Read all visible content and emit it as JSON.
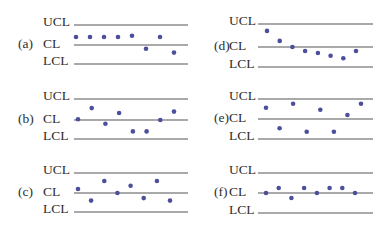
{
  "chart_data": [
    {
      "type": "scatter",
      "panel": "(a)",
      "title": "(a)",
      "limits": {
        "upper": "UCL",
        "center": "CL",
        "lower": "LCL"
      },
      "scale": {
        "LCL": -3,
        "CL": 0,
        "UCL": 3
      },
      "x": [
        1,
        2,
        3,
        4,
        5,
        6,
        7,
        8
      ],
      "values": [
        1.2,
        1.2,
        1.2,
        1.2,
        1.4,
        -0.6,
        1.2,
        -1.2
      ]
    },
    {
      "type": "scatter",
      "panel": "(b)",
      "title": "(b)",
      "limits": {
        "upper": "UCL",
        "center": "CL",
        "lower": "LCL"
      },
      "scale": {
        "LCL": -3,
        "CL": 0,
        "UCL": 3
      },
      "x": [
        1,
        2,
        3,
        4,
        5,
        6,
        7,
        8
      ],
      "values": [
        0.1,
        1.7,
        -0.6,
        1.0,
        -1.8,
        -1.8,
        0.0,
        1.2
      ]
    },
    {
      "type": "scatter",
      "panel": "(c)",
      "title": "(c)",
      "limits": {
        "upper": "UCL",
        "center": "CL",
        "lower": "LCL"
      },
      "scale": {
        "LCL": -3,
        "CL": 0,
        "UCL": 3
      },
      "x": [
        1,
        2,
        3,
        4,
        5,
        6,
        7,
        8
      ],
      "values": [
        0.6,
        -1.2,
        1.8,
        0.0,
        1.1,
        -0.8,
        1.8,
        -1.2
      ]
    },
    {
      "type": "scatter",
      "panel": "(d)",
      "title": "(d)",
      "limits": {
        "upper": "UCL",
        "center": "CL",
        "lower": "LCL"
      },
      "scale": {
        "LCL": -3,
        "CL": 0,
        "UCL": 3
      },
      "x": [
        1,
        2,
        3,
        4,
        5,
        6,
        7,
        8
      ],
      "values": [
        2.1,
        0.8,
        0.0,
        -0.6,
        -0.9,
        -1.3,
        -1.7,
        -0.6
      ]
    },
    {
      "type": "scatter",
      "panel": "(e)",
      "title": "(e)",
      "limits": {
        "upper": "UCL",
        "center": "CL",
        "lower": "LCL"
      },
      "scale": {
        "LCL": -3,
        "CL": 0,
        "UCL": 3
      },
      "x": [
        1,
        2,
        3,
        4,
        5,
        6,
        7,
        8
      ],
      "values": [
        1.7,
        -1.4,
        2.3,
        -1.9,
        1.4,
        -1.9,
        0.6,
        2.3
      ]
    },
    {
      "type": "scatter",
      "panel": "(f)",
      "title": "(f)",
      "limits": {
        "upper": "UCL",
        "center": "CL",
        "lower": "LCL"
      },
      "scale": {
        "LCL": -3,
        "CL": 0,
        "UCL": 3
      },
      "x": [
        1,
        2,
        3,
        4,
        5,
        6,
        7,
        8
      ],
      "values": [
        0.0,
        0.75,
        -0.75,
        0.75,
        0.0,
        0.75,
        0.75,
        0.0
      ]
    }
  ],
  "colors": {
    "point": "#4b4f9c",
    "line": "#555555",
    "text": "#2e2e2e"
  }
}
